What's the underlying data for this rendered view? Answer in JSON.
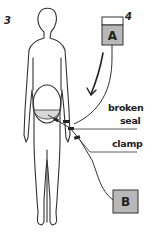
{
  "figure": {
    "step_left": "3",
    "step_right": "4",
    "bag_a": {
      "label": "A",
      "fill": "#b8b8b8"
    },
    "bag_b": {
      "label": "B",
      "fill": "#b8b8b8"
    },
    "annotations": {
      "broken_seal_line1": "broken",
      "broken_seal_line2": "seal",
      "clamp": "clamp"
    },
    "colors": {
      "stroke": "#333333",
      "abdomen_fill": "#d8d8d8",
      "background": "#ffffff"
    }
  }
}
